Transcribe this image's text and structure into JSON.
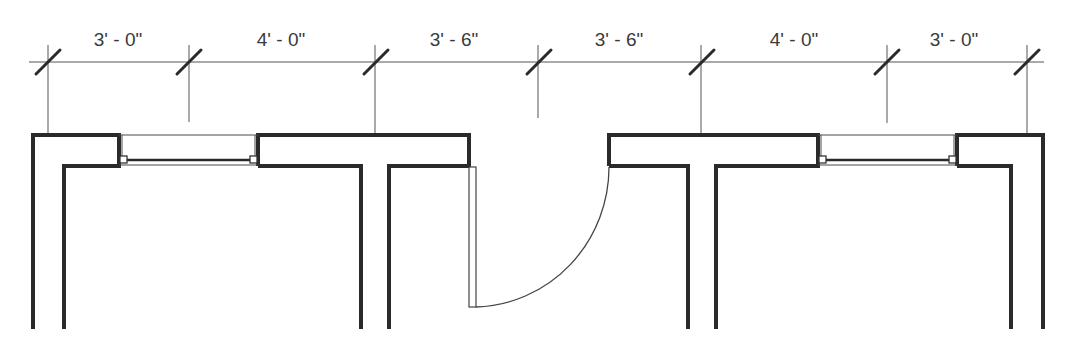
{
  "drawing": {
    "type": "architectural floor plan (partial)",
    "dimension_string": {
      "segments": [
        {
          "label": "3' - 0\"",
          "from_x": 48,
          "to_x": 189
        },
        {
          "label": "4' - 0\"",
          "from_x": 189,
          "to_x": 375
        },
        {
          "label": "3' - 6\"",
          "from_x": 375,
          "to_x": 538
        },
        {
          "label": "3' - 6\"",
          "from_x": 538,
          "to_x": 701
        },
        {
          "label": "4' - 0\"",
          "from_x": 701,
          "to_x": 887
        },
        {
          "label": "3' - 0\"",
          "from_x": 887,
          "to_x": 1027
        }
      ],
      "tick_style": "architectural slash"
    },
    "elements": {
      "windows": [
        {
          "name": "left-window",
          "center_x": 189
        },
        {
          "name": "right-window",
          "center_x": 887
        }
      ],
      "door": {
        "name": "entry-door",
        "swing": "inward, hinge at left jamb",
        "center_x": 538
      },
      "interior_walls": [
        {
          "name": "left-partition",
          "center_x": 375
        },
        {
          "name": "right-partition",
          "center_x": 701
        }
      ]
    },
    "colors": {
      "line": "#2a2a2a",
      "dimension": "#555555",
      "text": "#3a3a3a",
      "background": "#ffffff"
    }
  }
}
